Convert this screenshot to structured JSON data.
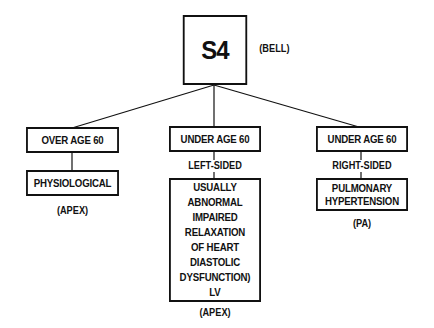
{
  "root": {
    "title": "S4",
    "note": "(BELL)"
  },
  "branches": [
    {
      "header": "OVER AGE 60",
      "side_label": "",
      "detail_lines": [
        "PHYSIOLOGICAL"
      ],
      "location": "(APEX)"
    },
    {
      "header": "UNDER AGE 60",
      "side_label": "LEFT-SIDED",
      "detail_lines": [
        "USUALLY",
        "ABNORMAL",
        "IMPAIRED",
        "RELAXATION",
        "OF HEART",
        "DIASTOLIC",
        "DYSFUNCTION)",
        "LV"
      ],
      "location": "(APEX)"
    },
    {
      "header": "UNDER AGE 60",
      "side_label": "RIGHT-SIDED",
      "detail_lines": [
        "PULMONARY",
        "HYPERTENSION"
      ],
      "location": "(PA)"
    }
  ],
  "colors": {
    "ink": "#111111",
    "background": "#ffffff"
  }
}
